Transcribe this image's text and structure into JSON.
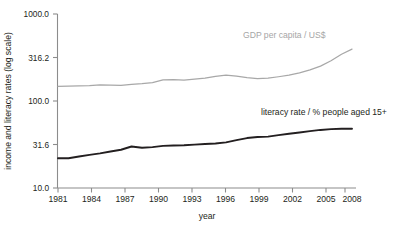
{
  "chart_data": {
    "type": "line",
    "title": "",
    "xlabel": "year",
    "ylabel": "income and literacy rates (log scale)",
    "log_scale_y": true,
    "grid": false,
    "legend_position": "inline-annotation",
    "xlim": [
      1981,
      2009
    ],
    "ylim": [
      10.0,
      1000.0
    ],
    "ytick_labels": [
      "1000.0",
      "316.2",
      "100.0",
      "31.6",
      "10.0"
    ],
    "ytick_values": [
      1000.0,
      316.2,
      100.0,
      31.6,
      10.0
    ],
    "xtick_labels": [
      "1981",
      "1984",
      "1987",
      "1990",
      "1993",
      "1996",
      "1999",
      "2002",
      "2005",
      "2008"
    ],
    "xtick_values": [
      1981,
      1984,
      1987,
      1990,
      1993,
      1996,
      1999,
      2002,
      2005,
      2008
    ],
    "x": [
      1981,
      1982,
      1983,
      1984,
      1985,
      1986,
      1987,
      1988,
      1989,
      1990,
      1991,
      1992,
      1993,
      1994,
      1995,
      1996,
      1997,
      1998,
      1999,
      2000,
      2001,
      2002,
      2003,
      2004,
      2005,
      2006,
      2007,
      2008,
      2009
    ],
    "series": [
      {
        "name": "GDP per capita / US$",
        "color": "#a8a8a8",
        "values": [
          147,
          148,
          149,
          150,
          153,
          152,
          151,
          155,
          158,
          163,
          175,
          176,
          174,
          178,
          183,
          192,
          198,
          193,
          186,
          181,
          183,
          190,
          198,
          210,
          228,
          252,
          290,
          345,
          395
        ]
      },
      {
        "name": "literacy rate / % people aged 15+",
        "color": "#231f20",
        "values": [
          22.0,
          22.0,
          23.0,
          24.0,
          25.0,
          26.3,
          27.5,
          30.0,
          29.0,
          29.5,
          30.5,
          30.8,
          31.0,
          31.5,
          32.0,
          32.5,
          33.5,
          35.5,
          37.5,
          38.5,
          39.0,
          40.5,
          42.0,
          43.5,
          45.0,
          46.5,
          47.5,
          48.0,
          48.0
        ]
      }
    ],
    "annotations": [
      {
        "name": "gdp-series-label",
        "text": "GDP per capita / US$",
        "color": "#a6a6a6"
      },
      {
        "name": "literacy-series-label",
        "text": "literacy rate / % people aged 15+",
        "color": "#231f20"
      }
    ]
  }
}
